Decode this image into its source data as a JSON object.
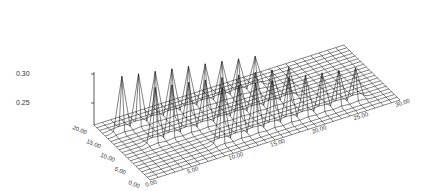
{
  "chart_data": {
    "type": "surface",
    "title": "",
    "xlabel": "",
    "ylabel": "",
    "zlabel": "",
    "x_axis": {
      "ticks": [
        "0.00",
        "5.00",
        "10.00",
        "15.00",
        "20.00",
        "25.00",
        "30.00"
      ],
      "range": [
        0,
        30
      ]
    },
    "y_axis": {
      "ticks": [
        "0.00",
        "5.00",
        "10.00",
        "15.00",
        "20.00"
      ],
      "range": [
        0,
        20
      ]
    },
    "z_axis": {
      "ticks": [
        "0.25",
        "0.30"
      ],
      "range": [
        0.2,
        0.31
      ]
    },
    "grid": true,
    "style": "wireframe",
    "baseline_z": 0.21,
    "ridges": [
      {
        "name": "front ridge",
        "y": 16,
        "peak_x": [
          2,
          4,
          6,
          8,
          10,
          12,
          14,
          16,
          18
        ],
        "peak_z": [
          0.3,
          0.295,
          0.29,
          0.285,
          0.28,
          0.275,
          0.27,
          0.265,
          0.26
        ]
      },
      {
        "name": "middle ridge",
        "y": 10,
        "peak_x": [
          4,
          6,
          8,
          10,
          12,
          14,
          16,
          18,
          20
        ],
        "peak_z": [
          0.3,
          0.295,
          0.29,
          0.285,
          0.28,
          0.275,
          0.27,
          0.265,
          0.26
        ]
      },
      {
        "name": "back ridge",
        "y": 4,
        "peak_x": [
          10,
          12,
          14,
          16,
          18,
          20,
          22,
          24,
          26
        ],
        "peak_z": [
          0.3,
          0.295,
          0.29,
          0.285,
          0.28,
          0.275,
          0.27,
          0.265,
          0.26
        ]
      }
    ]
  },
  "labels": {
    "z_ticks": [
      "0.30",
      "0.25"
    ],
    "y_ticks": [
      "20.00",
      "15.00",
      "10.00",
      "5.00",
      "0.00"
    ],
    "x_ticks": [
      "0.00",
      "5.00",
      "10.00",
      "15.00",
      "20.00",
      "25.00",
      "30.00"
    ]
  },
  "colors": {
    "line": "#1a1a1a",
    "background": "#ffffff"
  }
}
